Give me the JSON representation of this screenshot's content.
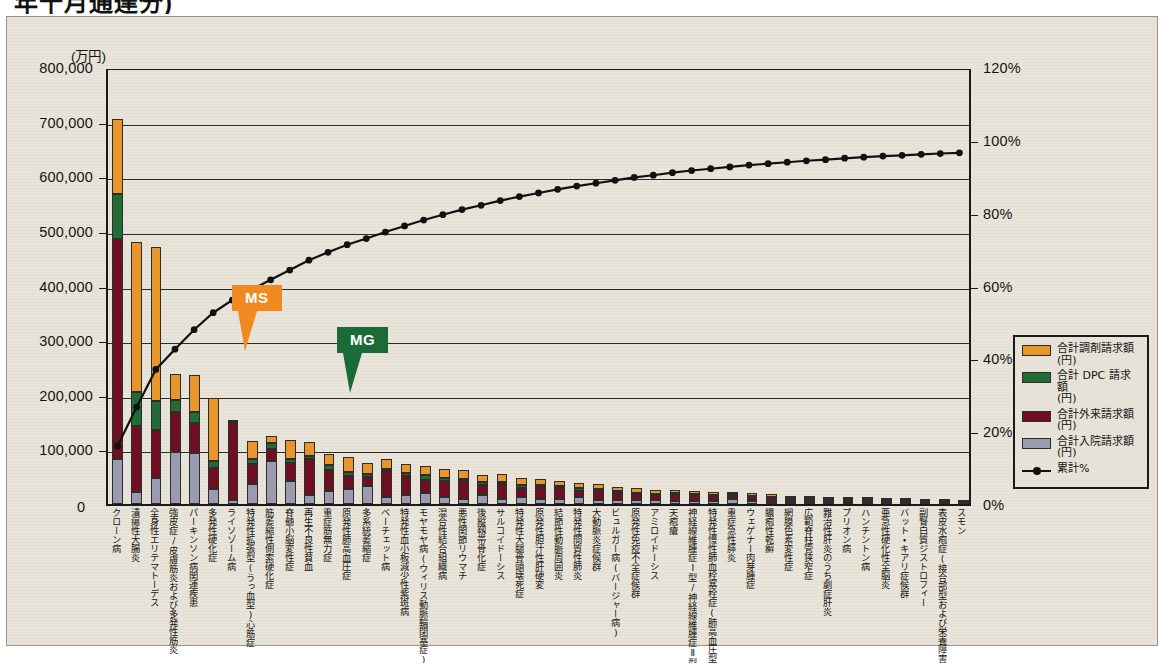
{
  "page": {
    "title_partial": "年十月通達分)"
  },
  "axes": {
    "left_unit": "(万円)",
    "left_ticks": [
      "800,000",
      "700,000",
      "600,000",
      "500,000",
      "400,000",
      "300,000",
      "200,000",
      "100,000",
      "0"
    ],
    "left_min": 0,
    "left_max": 800000,
    "right_ticks": [
      "120%",
      "100%",
      "80%",
      "60%",
      "40%",
      "20%",
      "0%"
    ],
    "right_min": 0,
    "right_max": 120
  },
  "legend": {
    "items": [
      {
        "label": "合計調剤請求額",
        "sub": "(円)",
        "color": "#E8952B",
        "type": "swatch"
      },
      {
        "label": "合計 DPC 請求額",
        "sub": "(円)",
        "color": "#226B35",
        "type": "swatch"
      },
      {
        "label": "合計外来請求額",
        "sub": "(円)",
        "color": "#6E1022",
        "type": "swatch"
      },
      {
        "label": "合計入院請求額",
        "sub": "(円)",
        "color": "#9B9BB0",
        "type": "swatch"
      },
      {
        "label": "累計%",
        "sub": "",
        "color": "#111111",
        "type": "line"
      }
    ]
  },
  "callouts": [
    {
      "name": "MS",
      "label": "MS",
      "color": "#F08A1E",
      "x": 225,
      "y": 268
    },
    {
      "name": "MG",
      "label": "MG",
      "color": "#1B6B39",
      "x": 330,
      "y": 310
    }
  ],
  "chart_data": {
    "type": "bar",
    "title": "",
    "xlabel": "",
    "ylabel": "(万円)",
    "ylabel_right": "%",
    "ylim": [
      0,
      800000
    ],
    "ylim_right": [
      0,
      120
    ],
    "grid": true,
    "legend_position": "right",
    "categories": [
      "クローン病",
      "潰瘍性大腸炎",
      "全身性エリテマトーデス",
      "強皮症/皮膚筋炎および多発性筋炎",
      "パーキンソン病関連疾患",
      "多発性硬化症",
      "ライソゾーム病",
      "特発性拡張型(うっ血型)心筋症",
      "筋萎縮性側索硬化症",
      "脊髄小脳変性症",
      "再生不良性貧血",
      "重症筋無力症",
      "原発性肺高血圧症",
      "多系統萎縮症",
      "ベーチェット病",
      "特発性血小板減少性紫斑病",
      "モヤモヤ病(ウィリス動脈輪閉塞症)",
      "混合性結合組織病",
      "悪性関節リウマチ",
      "後縦靱帯骨化症",
      "サルコイドーシス",
      "特発性大腿骨頭壊死症",
      "原発性胆汁性肝硬変",
      "結節性動脈周囲炎",
      "特発性間質性肺炎",
      "大動脈炎症候群",
      "ビュルガー病(バージャー病)",
      "原発性免疫不全症候群",
      "アミロイドーシス",
      "天疱瘡",
      "神経線維腫症Ⅰ型/神経線維腫症Ⅱ型",
      "特発性慢性肺血栓塞栓症(肺高血圧型)",
      "重症急性膵炎",
      "ウェゲナー肉芽腫症",
      "膿疱性乾癬",
      "網膜色素変性症",
      "広範脊柱管狭窄症",
      "難治性肝炎のうち劇症肝炎",
      "プリオン病",
      "ハンチントン病",
      "亜急性硬化性全脳炎",
      "バット・キアリ症候群",
      "副腎白質ジストロフィー",
      "表皮水疱症(接合部型および栄養障害型)",
      "スモン"
    ],
    "series": [
      {
        "name": "合計入院請求額(円)",
        "color": "#9B9BB0",
        "values": [
          82000,
          22000,
          48000,
          95000,
          93000,
          28000,
          8000,
          36000,
          78000,
          42000,
          16000,
          24000,
          28000,
          33000,
          13000,
          16000,
          20000,
          13000,
          10000,
          16000,
          9000,
          13000,
          9000,
          9000,
          13000,
          8000,
          7000,
          7000,
          8000,
          6000,
          5000,
          6000,
          9000,
          5000,
          4000,
          3000,
          4000,
          4000,
          4000,
          3000,
          2500,
          2500,
          2500,
          2000,
          1500
        ]
      },
      {
        "name": "合計外来請求額(円)",
        "color": "#6E1022",
        "values": [
          403000,
          120000,
          88000,
          73000,
          55000,
          38000,
          140000,
          38000,
          22000,
          33000,
          66000,
          38000,
          24000,
          16000,
          47000,
          36000,
          24000,
          29000,
          32000,
          18000,
          28000,
          16000,
          22000,
          20000,
          11000,
          16000,
          13000,
          11000,
          8000,
          11000,
          11000,
          8000,
          5000,
          7000,
          7000,
          7000,
          5000,
          4000,
          4000,
          4000,
          3000,
          3000,
          2500,
          2500,
          2000
        ]
      },
      {
        "name": "合計 DPC 請求額(円)",
        "color": "#226B35",
        "values": [
          82000,
          63000,
          53000,
          22000,
          20000,
          13000,
          3000,
          8000,
          11000,
          8000,
          6000,
          9000,
          7000,
          6000,
          5000,
          5000,
          9000,
          5000,
          4000,
          7000,
          4000,
          6000,
          4000,
          4000,
          6000,
          3000,
          3000,
          3000,
          3000,
          3000,
          2500,
          3000,
          5000,
          2500,
          2000,
          1500,
          2000,
          2000,
          2000,
          1500,
          1500,
          1500,
          1000,
          1000,
          800
        ]
      },
      {
        "name": "合計調剤請求額(円)",
        "color": "#E8952B",
        "values": [
          138000,
          275000,
          281000,
          48000,
          69000,
          116000,
          2000,
          33000,
          14000,
          35000,
          26000,
          21000,
          27000,
          20000,
          17000,
          16000,
          17000,
          18000,
          17000,
          13000,
          14000,
          13000,
          11000,
          10000,
          9000,
          9000,
          9000,
          9000,
          7000,
          6000,
          6000,
          5000,
          2000,
          5000,
          5000,
          4000,
          4000,
          3000,
          3000,
          3000,
          2000,
          2000,
          2000,
          1500,
          1200
        ]
      }
    ],
    "cumulative_label": "累計%",
    "cumulative_color": "#111111",
    "cumulative_percent": [
      16.0,
      26.8,
      37.2,
      42.8,
      48.2,
      52.9,
      56.4,
      59.2,
      62.0,
      64.7,
      67.4,
      69.6,
      71.7,
      73.4,
      75.2,
      76.9,
      78.5,
      80.0,
      81.4,
      82.6,
      83.9,
      85.0,
      86.0,
      87.0,
      87.9,
      88.7,
      89.5,
      90.3,
      90.9,
      91.6,
      92.2,
      92.7,
      93.2,
      93.7,
      94.1,
      94.5,
      94.9,
      95.2,
      95.6,
      95.9,
      96.2,
      96.4,
      96.7,
      96.9,
      97.1
    ]
  }
}
